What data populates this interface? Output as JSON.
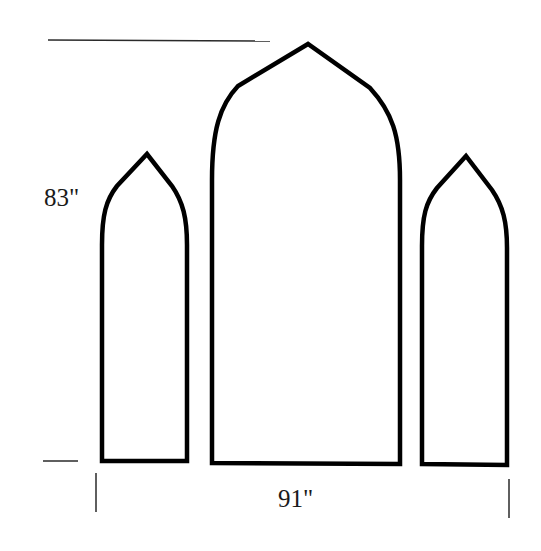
{
  "diagram": {
    "title": "",
    "dimensions": {
      "height": "83\"",
      "width": "91\""
    },
    "panels": [
      {
        "name": "left-panel",
        "shape": "gothic-arch"
      },
      {
        "name": "center-panel",
        "shape": "gothic-arch"
      },
      {
        "name": "right-panel",
        "shape": "gothic-arch"
      }
    ],
    "colors": {
      "stroke": "#000000",
      "dimension_line": "#2a2a2a",
      "background": "#ffffff"
    }
  }
}
